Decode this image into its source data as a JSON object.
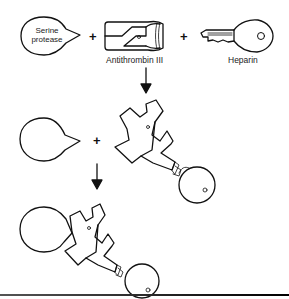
{
  "diagram": {
    "reactants": {
      "protease_label": "Serine\nprotease",
      "protease_line1": "Serine",
      "protease_line2": "protease",
      "antithrombin_label": "Antithrombin III",
      "heparin_label": "Heparin"
    },
    "operators": {
      "plus": "+"
    },
    "steps": [
      {
        "name": "step-1",
        "description": "Serine protease + Antithrombin III + Heparin"
      },
      {
        "name": "step-2",
        "description": "Free protease + heparin-activated antithrombin III complex"
      },
      {
        "name": "step-3",
        "description": "Protease bound to antithrombin III-heparin complex"
      }
    ],
    "colors": {
      "stroke": "#111111",
      "background": "#ffffff",
      "rule": "#333333"
    }
  }
}
